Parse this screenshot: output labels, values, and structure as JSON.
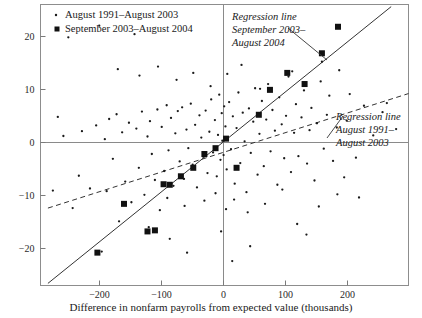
{
  "chart_data": {
    "type": "scatter",
    "title": "",
    "xlabel": "Difference in nonfarm payrolls from expected value (thousands)",
    "ylabel": "",
    "xlim": [
      -295,
      300
    ],
    "ylim": [
      -27,
      26
    ],
    "xticks": [
      -200,
      -100,
      0,
      100,
      200
    ],
    "xtick_labels": [
      "−200",
      "−100",
      "0",
      "100",
      "200"
    ],
    "yticks": [
      -20,
      -10,
      0,
      10,
      20
    ],
    "ytick_labels": [
      "−20",
      "−10",
      "0",
      "10",
      "20"
    ],
    "grid": false,
    "legend_position": "top-left",
    "series": [
      {
        "name": "August 1991–August 2003",
        "marker": "dot",
        "marker_size": 2,
        "color": "#1a1a1a",
        "points": [
          [
            -258,
            1.2
          ],
          [
            -243,
            -12.4
          ],
          [
            -233,
            -6.3
          ],
          [
            -228,
            2.1
          ],
          [
            -215,
            -8.7
          ],
          [
            -205,
            3.2
          ],
          [
            -200,
            22.0
          ],
          [
            -196,
            -20.6
          ],
          [
            -191,
            0.6
          ],
          [
            -188,
            -9.2
          ],
          [
            -184,
            4.4
          ],
          [
            -178,
            -3.1
          ],
          [
            -172,
            5.3
          ],
          [
            -168,
            -14.9
          ],
          [
            -163,
            1.9
          ],
          [
            -158,
            -7.4
          ],
          [
            -152,
            3.7
          ],
          [
            -148,
            -11.3
          ],
          [
            -143,
            20.4
          ],
          [
            -140,
            2.6
          ],
          [
            -136,
            -4.8
          ],
          [
            -131,
            5.8
          ],
          [
            -127,
            -9.9
          ],
          [
            -122,
            1.1
          ],
          [
            -118,
            4.0
          ],
          [
            -115,
            -2.2
          ],
          [
            -110,
            -7.1
          ],
          [
            -106,
            6.2
          ],
          [
            -102,
            -12.8
          ],
          [
            -99,
            2.9
          ],
          [
            -95,
            -5.4
          ],
          [
            -91,
            7.0
          ],
          [
            -88,
            -1.5
          ],
          [
            -84,
            4.6
          ],
          [
            -80,
            -8.2
          ],
          [
            -77,
            1.7
          ],
          [
            -73,
            5.9
          ],
          [
            -70,
            -3.6
          ],
          [
            -66,
            6.6
          ],
          [
            -63,
            -6.9
          ],
          [
            -59,
            2.4
          ],
          [
            -56,
            -1.1
          ],
          [
            -52,
            7.3
          ],
          [
            -49,
            -4.2
          ],
          [
            -45,
            3.3
          ],
          [
            -42,
            -8.5
          ],
          [
            -38,
            5.1
          ],
          [
            -35,
            0.9
          ],
          [
            -32,
            -2.7
          ],
          [
            -28,
            6.0
          ],
          [
            -25,
            -5.8
          ],
          [
            -22,
            2.0
          ],
          [
            -19,
            8.1
          ],
          [
            -16,
            -1.9
          ],
          [
            -13,
            4.2
          ],
          [
            -10,
            -6.4
          ],
          [
            -8,
            1.4
          ],
          [
            -6,
            9.0
          ],
          [
            -4,
            -3.3
          ],
          [
            -2,
            5.5
          ],
          [
            -1,
            0.3
          ],
          [
            1,
            -2.4
          ],
          [
            2,
            6.8
          ],
          [
            4,
            3.0
          ],
          [
            6,
            -5.1
          ],
          [
            8,
            1.0
          ],
          [
            10,
            7.6
          ],
          [
            13,
            -1.3
          ],
          [
            16,
            4.9
          ],
          [
            19,
            -7.8
          ],
          [
            22,
            2.7
          ],
          [
            25,
            9.4
          ],
          [
            28,
            -3.9
          ],
          [
            32,
            5.6
          ],
          [
            35,
            0.2
          ],
          [
            38,
            -9.4
          ],
          [
            42,
            6.4
          ],
          [
            45,
            -2.0
          ],
          [
            49,
            3.9
          ],
          [
            52,
            10.2
          ],
          [
            56,
            -6.1
          ],
          [
            59,
            1.6
          ],
          [
            63,
            7.8
          ],
          [
            66,
            -4.5
          ],
          [
            70,
            4.3
          ],
          [
            73,
            11.0
          ],
          [
            77,
            -1.7
          ],
          [
            80,
            6.1
          ],
          [
            84,
            2.2
          ],
          [
            88,
            -8.0
          ],
          [
            91,
            8.5
          ],
          [
            95,
            3.4
          ],
          [
            99,
            -3.0
          ],
          [
            102,
            5.0
          ],
          [
            106,
            12.4
          ],
          [
            110,
            -5.6
          ],
          [
            115,
            1.8
          ],
          [
            118,
            7.2
          ],
          [
            122,
            -2.6
          ],
          [
            127,
            4.7
          ],
          [
            131,
            9.8
          ],
          [
            136,
            -4.0
          ],
          [
            140,
            2.3
          ],
          [
            143,
            6.5
          ],
          [
            148,
            -7.2
          ],
          [
            152,
            3.6
          ],
          [
            158,
            11.5
          ],
          [
            163,
            -1.2
          ],
          [
            168,
            5.2
          ],
          [
            172,
            8.8
          ],
          [
            178,
            -3.5
          ],
          [
            184,
            2.8
          ],
          [
            188,
            13.6
          ],
          [
            196,
            -6.6
          ],
          [
            200,
            4.1
          ],
          [
            205,
            9.1
          ],
          [
            215,
            -2.9
          ],
          [
            228,
            6.9
          ],
          [
            243,
            1.3
          ],
          [
            258,
            5.7
          ],
          [
            -120,
            -16.0
          ],
          [
            -90,
            -10.5
          ],
          [
            -62,
            -12.0
          ],
          [
            -30,
            -11.0
          ],
          [
            -12,
            -9.6
          ],
          [
            5,
            -12.6
          ],
          [
            18,
            -10.8
          ],
          [
            40,
            -13.2
          ],
          [
            68,
            -11.6
          ],
          [
            96,
            -8.9
          ],
          [
            120,
            -15.4
          ],
          [
            155,
            -12.1
          ],
          [
            185,
            -9.8
          ],
          [
            -170,
            13.8
          ],
          [
            -135,
            12.6
          ],
          [
            -105,
            14.3
          ],
          [
            -75,
            11.8
          ],
          [
            -48,
            13.1
          ],
          [
            -20,
            10.6
          ],
          [
            7,
            12.9
          ],
          [
            30,
            14.6
          ],
          [
            60,
            10.1
          ],
          [
            112,
            13.4
          ],
          [
            160,
            15.2
          ],
          [
            -250,
            19.8
          ],
          [
            -86,
            -18.2
          ],
          [
            -58,
            -20.8
          ],
          [
            15,
            -22.4
          ],
          [
            -3,
            -16.8
          ],
          [
            44,
            -19.6
          ],
          [
            135,
            -17.4
          ],
          [
            220,
            -10.4
          ],
          [
            265,
            7.4
          ],
          [
            280,
            2.5
          ],
          [
            -275,
            -9.1
          ],
          [
            -267,
            4.8
          ]
        ]
      },
      {
        "name": "September 2003–August 2004",
        "marker": "square",
        "marker_size": 6,
        "color": "#111111",
        "points": [
          [
            -203,
            -20.8
          ],
          [
            -160,
            -11.6
          ],
          [
            -122,
            -16.8
          ],
          [
            -110,
            -16.6
          ],
          [
            -96,
            -7.9
          ],
          [
            -86,
            -8.0
          ],
          [
            -68,
            -6.4
          ],
          [
            -48,
            -4.8
          ],
          [
            -30,
            -2.2
          ],
          [
            -12,
            -1.1
          ],
          [
            5,
            0.7
          ],
          [
            22,
            -4.8
          ],
          [
            58,
            5.2
          ],
          [
            76,
            9.9
          ],
          [
            104,
            13.1
          ],
          [
            132,
            11.0
          ],
          [
            160,
            16.8
          ],
          [
            186,
            21.8
          ]
        ]
      }
    ],
    "regression_lines": [
      {
        "name": "Regression line September 2003–August 2004",
        "style": "solid",
        "x_start": -283,
        "y_start": -26.6,
        "x_end": 272,
        "y_end": 25.6
      },
      {
        "name": "Regression line August 1991–August 2003",
        "style": "dashed",
        "x_start": -283,
        "y_start": -12.4,
        "x_end": 300,
        "y_end": 9.2
      }
    ],
    "annotations": [
      {
        "id": "annot-steep",
        "lines": [
          "Regression line",
          "September 2003–",
          "August 2004"
        ],
        "leader_from_x": 288,
        "leader_from_y": 28,
        "leader_to_x": 327,
        "leader_to_y": 60
      },
      {
        "id": "annot-shallow",
        "lines": [
          "Regression line",
          "August 1991–",
          "August 2003"
        ],
        "leader_from_x": 343,
        "leader_from_y": 116,
        "leader_to_x": 327,
        "leader_to_y": 138
      }
    ]
  },
  "legend": {
    "items": [
      {
        "marker": "dot",
        "label": "August 1991–August 2003"
      },
      {
        "marker": "square",
        "label": "September 2003–August 2004"
      }
    ]
  },
  "axis": {
    "x_title": "Difference in nonfarm payrolls from expected value (thousands)"
  },
  "colors": {
    "ink": "#1a1a1a",
    "frame": "#888888",
    "axis": "#777777",
    "background": "#ffffff"
  }
}
